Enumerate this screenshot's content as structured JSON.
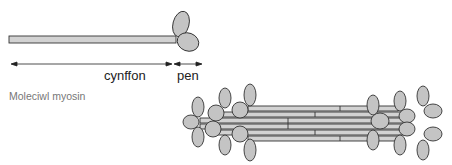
{
  "figure": {
    "labels": {
      "tail": "cynffon",
      "head": "pen",
      "caption": "Moleciwl myosin"
    },
    "colors": {
      "fill": "#c4c4c4",
      "rod_fill": "#d2d2d2",
      "stroke": "#333333",
      "caption": "#777777"
    }
  }
}
